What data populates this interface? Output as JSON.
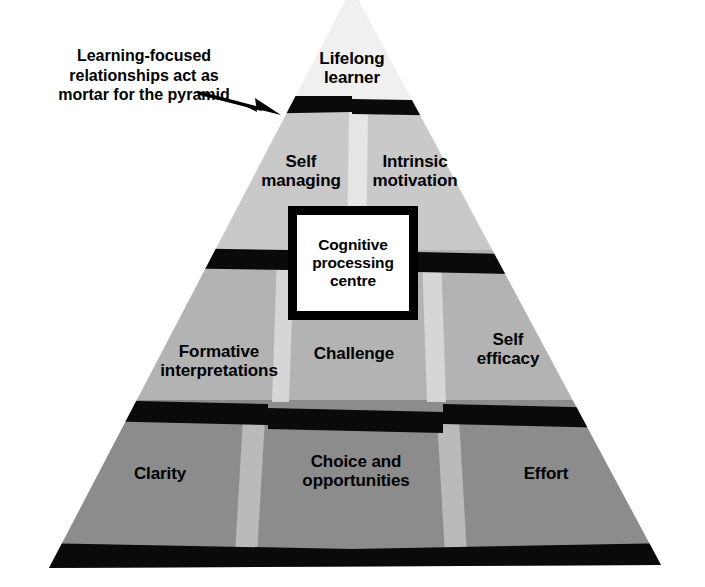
{
  "diagram": {
    "annotation": {
      "text": "Learning-focused\nrelationships act as\nmortar for the pyramid",
      "font_size": 16
    },
    "centre": {
      "label": "Cognitive\nprocessing\ncentre",
      "fill": "#ffffff",
      "border": "#000000"
    },
    "mortar_color": "#000000",
    "divider_color": "#e3e3e3",
    "tiers": [
      {
        "name": "apex",
        "fill": "#f0f0f0",
        "blocks": [
          {
            "label": "Lifelong\nlearner",
            "x": 352,
            "y": 70,
            "font_size": 17
          }
        ]
      },
      {
        "name": "tier-2",
        "fill": "#c9c9c9",
        "blocks": [
          {
            "label": "Self\nmanaging",
            "x": 301,
            "y": 173,
            "font_size": 17
          },
          {
            "label": "Intrinsic\nmotivation",
            "x": 415,
            "y": 173,
            "font_size": 17
          }
        ]
      },
      {
        "name": "tier-3",
        "fill": "#b3b3b3",
        "blocks": [
          {
            "label": "Formative\ninterpretations",
            "x": 218,
            "y": 365,
            "font_size": 17
          },
          {
            "label": "Challenge",
            "x": 353,
            "y": 356,
            "font_size": 17
          },
          {
            "label": "Self\nefficacy",
            "x": 508,
            "y": 365,
            "font_size": 17
          }
        ]
      },
      {
        "name": "tier-4",
        "fill": "#8c8c8c",
        "blocks": [
          {
            "label": "Clarity",
            "x": 160,
            "y": 486,
            "font_size": 17
          },
          {
            "label": "Choice and\nopportunities",
            "x": 356,
            "y": 486,
            "font_size": 17
          },
          {
            "label": "Effort",
            "x": 546,
            "y": 486,
            "font_size": 17
          }
        ]
      }
    ]
  }
}
